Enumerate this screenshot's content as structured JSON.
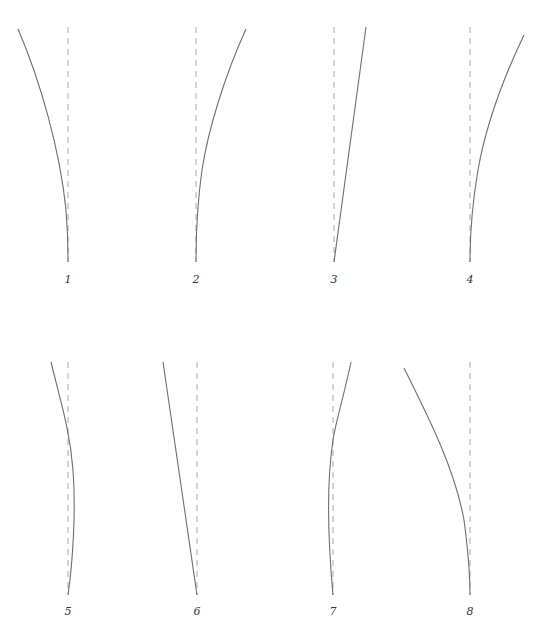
{
  "figure": {
    "top_cutoff_text": "•",
    "panels": [
      {
        "id": "1",
        "label": "1",
        "ref_x": 68,
        "ref_top": 27,
        "ref_bottom": 262,
        "label_y": 283,
        "path": "M18 29 C40 80, 60 150, 66 210 C68 235, 68 250, 68 262"
      },
      {
        "id": "2",
        "label": "2",
        "ref_x": 196,
        "ref_top": 27,
        "ref_bottom": 262,
        "label_y": 283,
        "path": "M246 29 C225 75, 208 130, 202 170 C197 205, 196 235, 196 262"
      },
      {
        "id": "3",
        "label": "3",
        "ref_x": 334,
        "ref_top": 27,
        "ref_bottom": 262,
        "label_y": 283,
        "path": "M366 27 L334 262"
      },
      {
        "id": "4",
        "label": "4",
        "ref_x": 470,
        "ref_top": 27,
        "ref_bottom": 262,
        "label_y": 283,
        "path": "M524 35 C500 85, 485 130, 478 170 C472 205, 470 235, 470 262"
      },
      {
        "id": "5",
        "label": "5",
        "ref_x": 68,
        "ref_top": 362,
        "ref_bottom": 595,
        "label_y": 615,
        "path": "M51 362 C60 400, 70 430, 73 470 C76 510, 73 560, 68 595"
      },
      {
        "id": "6",
        "label": "6",
        "ref_x": 197,
        "ref_top": 362,
        "ref_bottom": 595,
        "label_y": 615,
        "path": "M163 362 L197 595"
      },
      {
        "id": "7",
        "label": "7",
        "ref_x": 333,
        "ref_top": 362,
        "ref_bottom": 595,
        "label_y": 615,
        "path": "M351 362 C343 400, 336 420, 333 440 C327 480, 327 530, 333 595"
      },
      {
        "id": "8",
        "label": "8",
        "ref_x": 470,
        "ref_top": 362,
        "ref_bottom": 595,
        "label_y": 615,
        "path": "M404 368 C430 420, 455 470, 464 520 C468 550, 470 575, 470 595"
      }
    ]
  },
  "colors": {
    "curve": "#6e6e6e",
    "reference_dash": "#a8a8a8",
    "label": "#333333",
    "background": "#ffffff"
  }
}
